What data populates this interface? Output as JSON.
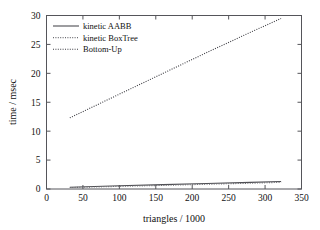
{
  "chart_data": {
    "type": "line",
    "title": "",
    "xlabel": "triangles / 1000",
    "ylabel": "time / msec",
    "xlim": [
      0,
      350
    ],
    "ylim": [
      0,
      30
    ],
    "xticks": [
      0,
      50,
      100,
      150,
      200,
      250,
      300,
      350
    ],
    "yticks": [
      0,
      5,
      10,
      15,
      20,
      25,
      30
    ],
    "grid": false,
    "legend_position": "upper-left-inside",
    "series": [
      {
        "name": "kinetic AABB",
        "style": "solid",
        "color": "#4d4d52",
        "x": [
          32,
          100,
          160,
          220,
          280,
          322
        ],
        "values": [
          0.3,
          0.55,
          0.75,
          0.95,
          1.15,
          1.3
        ]
      },
      {
        "name": "kinetic BoxTree",
        "style": "dotted",
        "color": "#6b6b70",
        "x": [
          32,
          100,
          160,
          220,
          280,
          322
        ],
        "values": [
          0.25,
          0.45,
          0.62,
          0.82,
          1.0,
          1.15
        ]
      },
      {
        "name": "Bottom-Up",
        "style": "dotted",
        "color": "#3a3a40",
        "x": [
          32,
          100,
          160,
          220,
          280,
          322
        ],
        "values": [
          12.3,
          16.4,
          20.0,
          23.6,
          27.1,
          29.5
        ]
      }
    ]
  },
  "legend": {
    "entries": [
      {
        "label": "kinetic AABB"
      },
      {
        "label": "kinetic BoxTree"
      },
      {
        "label": "Bottom-Up"
      }
    ]
  },
  "axes": {
    "x_tick_labels": [
      "0",
      "50",
      "100",
      "150",
      "200",
      "250",
      "300",
      "350"
    ],
    "y_tick_labels": [
      "0",
      "5",
      "10",
      "15",
      "20",
      "25",
      "30"
    ],
    "x_title": "triangles / 1000",
    "y_title": "time / msec"
  },
  "colors": {
    "background": "#ffffff",
    "frame": "#55555a",
    "text": "#111111"
  }
}
